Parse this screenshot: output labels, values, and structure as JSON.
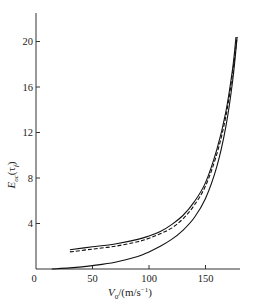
{
  "chart_data": {
    "type": "line",
    "title": "",
    "xlabel": "V0/(m/s^-1)",
    "xlabel_main": "V",
    "xlabel_sub": "0",
    "xlabel_rest": "/(m/s",
    "xlabel_sup": "−1",
    "xlabel_close": ")",
    "ylabel": "E_oc(τ_f)",
    "ylabel_main": "E",
    "ylabel_sub": "oc",
    "ylabel_rest": "(τ",
    "ylabel_sub2": "f",
    "ylabel_close": ")",
    "xlim": [
      0,
      180
    ],
    "ylim": [
      0,
      22
    ],
    "x_ticks": [
      0,
      50,
      100,
      150
    ],
    "y_ticks": [
      4,
      8,
      12,
      16,
      20
    ],
    "grid": false,
    "legend": "none",
    "series": [
      {
        "name": "upper solid",
        "style": "solid",
        "x": [
          30,
          50,
          70,
          90,
          100,
          110,
          120,
          130,
          140,
          150,
          160,
          168,
          174,
          177
        ],
        "y": [
          1.7,
          1.95,
          2.2,
          2.6,
          2.9,
          3.3,
          3.9,
          4.7,
          5.9,
          7.6,
          10.5,
          13.8,
          17.6,
          20.4
        ]
      },
      {
        "name": "dashed",
        "style": "dashed",
        "x": [
          30,
          50,
          70,
          90,
          100,
          110,
          120,
          130,
          140,
          150,
          160,
          168,
          174,
          178
        ],
        "y": [
          1.5,
          1.75,
          2.0,
          2.4,
          2.7,
          3.1,
          3.6,
          4.4,
          5.6,
          7.3,
          10.1,
          13.4,
          17.2,
          20.4
        ]
      },
      {
        "name": "lower solid",
        "style": "solid",
        "x": [
          14,
          30,
          50,
          70,
          90,
          100,
          110,
          120,
          130,
          140,
          150,
          160,
          168,
          174,
          178
        ],
        "y": [
          0.0,
          0.1,
          0.3,
          0.6,
          1.1,
          1.5,
          2.0,
          2.6,
          3.4,
          4.5,
          6.2,
          9.0,
          12.5,
          16.5,
          20.4
        ]
      }
    ]
  }
}
